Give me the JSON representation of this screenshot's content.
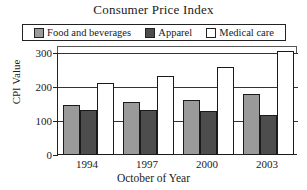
{
  "chart_data": {
    "type": "bar",
    "title": "Consumer Price Index",
    "xlabel": "October of Year",
    "ylabel": "CPI Value",
    "categories": [
      "1994",
      "1997",
      "2000",
      "2003"
    ],
    "series": [
      {
        "name": "Food and beverages",
        "color": "#9a9a9a",
        "values": [
          148,
          155,
          163,
          178
        ]
      },
      {
        "name": "Apparel",
        "color": "#4d4d4d",
        "values": [
          133,
          131,
          128,
          118
        ]
      },
      {
        "name": "Medical care",
        "color": "#ffffff",
        "values": [
          212,
          232,
          258,
          305
        ]
      }
    ],
    "ylim": [
      0,
      300
    ],
    "yticks": [
      "300",
      "200",
      "100",
      "0"
    ],
    "ytick_values": [
      300,
      200,
      100,
      0
    ],
    "grid": true,
    "legend_position": "top",
    "note": "Medical care bar for 2003 is clipped at the top of the plot frame"
  },
  "legend": {
    "items": [
      {
        "label": "Food and beverages"
      },
      {
        "label": "Apparel"
      },
      {
        "label": "Medical care"
      }
    ]
  }
}
